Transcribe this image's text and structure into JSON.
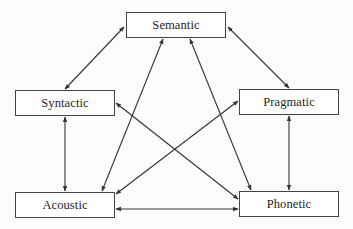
{
  "diagram": {
    "type": "network",
    "nodes": [
      {
        "id": "semantic",
        "label": "Semantic",
        "x": 126,
        "y": 12,
        "w": 100,
        "h": 26
      },
      {
        "id": "syntactic",
        "label": "Syntactic",
        "x": 15,
        "y": 90,
        "w": 100,
        "h": 26
      },
      {
        "id": "pragmatic",
        "label": "Pragmatic",
        "x": 239,
        "y": 89,
        "w": 100,
        "h": 26
      },
      {
        "id": "acoustic",
        "label": "Acoustic",
        "x": 15,
        "y": 192,
        "w": 100,
        "h": 26
      },
      {
        "id": "phonetic",
        "label": "Phonetic",
        "x": 239,
        "y": 191,
        "w": 100,
        "h": 26
      }
    ],
    "edges": [
      {
        "from": "semantic",
        "to": "syntactic",
        "bidirectional": true,
        "x1": 124,
        "y1": 27,
        "x2": 65,
        "y2": 89
      },
      {
        "from": "semantic",
        "to": "pragmatic",
        "bidirectional": true,
        "x1": 228,
        "y1": 27,
        "x2": 289,
        "y2": 88
      },
      {
        "from": "semantic",
        "to": "acoustic",
        "bidirectional": true,
        "x1": 163,
        "y1": 39,
        "x2": 102,
        "y2": 191
      },
      {
        "from": "semantic",
        "to": "phonetic",
        "bidirectional": true,
        "x1": 190,
        "y1": 39,
        "x2": 251,
        "y2": 190
      },
      {
        "from": "syntactic",
        "to": "acoustic",
        "bidirectional": true,
        "x1": 65,
        "y1": 117,
        "x2": 65,
        "y2": 191
      },
      {
        "from": "pragmatic",
        "to": "phonetic",
        "bidirectional": true,
        "x1": 289,
        "y1": 116,
        "x2": 289,
        "y2": 190
      },
      {
        "from": "syntactic",
        "to": "phonetic",
        "bidirectional": true,
        "x1": 116,
        "y1": 103,
        "x2": 238,
        "y2": 199
      },
      {
        "from": "pragmatic",
        "to": "acoustic",
        "bidirectional": true,
        "x1": 238,
        "y1": 101,
        "x2": 116,
        "y2": 194
      },
      {
        "from": "acoustic",
        "to": "phonetic",
        "bidirectional": true,
        "x1": 116,
        "y1": 209,
        "x2": 238,
        "y2": 209
      }
    ],
    "colors": {
      "line": "#333333",
      "border": "#444444",
      "text": "#1e1e1e",
      "background": "#fcfcfc"
    }
  }
}
